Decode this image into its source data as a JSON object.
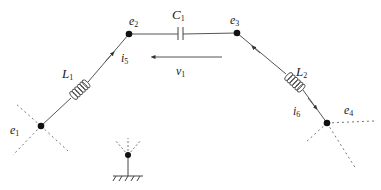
{
  "diagram": {
    "type": "circuit",
    "colors": {
      "wire": "#555555",
      "node": "#111111",
      "dashed": "#777777",
      "text": "#222222"
    },
    "nodes": [
      {
        "id": "e1",
        "label": "e",
        "sub": "1"
      },
      {
        "id": "e2",
        "label": "e",
        "sub": "2"
      },
      {
        "id": "e3",
        "label": "e",
        "sub": "3"
      },
      {
        "id": "e4",
        "label": "e",
        "sub": "4"
      },
      {
        "id": "ground",
        "label": ""
      }
    ],
    "components": [
      {
        "id": "L1",
        "kind": "inductor",
        "label": "L",
        "sub": "1",
        "between": [
          "e1",
          "e2"
        ]
      },
      {
        "id": "C1",
        "kind": "capacitor",
        "label": "C",
        "sub": "1",
        "between": [
          "e2",
          "e3"
        ]
      },
      {
        "id": "L2",
        "kind": "inductor",
        "label": "L",
        "sub": "2",
        "between": [
          "e3",
          "e4"
        ]
      }
    ],
    "currents": [
      {
        "id": "i5",
        "label": "i",
        "sub": "5",
        "branch": "L1",
        "direction": "e1 to e2"
      },
      {
        "id": "i6",
        "label": "i",
        "sub": "6",
        "branch": "L2",
        "direction": "e3 to e4"
      }
    ],
    "voltages": [
      {
        "id": "v1",
        "label": "v",
        "sub": "1",
        "across": "C1",
        "direction": "e3 to e2"
      }
    ]
  }
}
